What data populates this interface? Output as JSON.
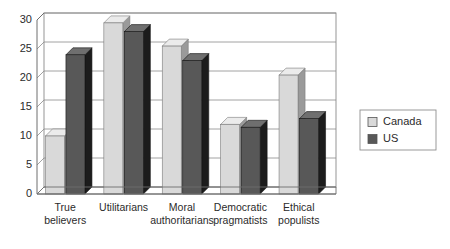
{
  "chart_data": {
    "type": "bar",
    "title": "",
    "subtitle": "",
    "xlabel": "",
    "ylabel": "",
    "categories": [
      "True believers",
      "Utilitarians",
      "Moral authoritarians",
      "Democratic pragmatists",
      "Ethical populists"
    ],
    "category_lines": [
      [
        "True",
        "believers"
      ],
      [
        "Utilitarians",
        ""
      ],
      [
        "Moral",
        "authoritarians"
      ],
      [
        "Democratic",
        "pragmatists"
      ],
      [
        "Ethical",
        "populists"
      ]
    ],
    "series": [
      {
        "name": "Canada",
        "color": "#d9d9d9",
        "values": [
          10,
          29.5,
          25.5,
          12,
          20.5
        ]
      },
      {
        "name": "US",
        "color": "#585858",
        "values": [
          24,
          28,
          23,
          11.5,
          13
        ]
      }
    ],
    "ylim": [
      0,
      30
    ],
    "yticks": [
      0,
      5,
      10,
      15,
      20,
      25,
      30
    ],
    "ytick_labels": [
      "0",
      "5",
      "10",
      "15",
      "20",
      "25",
      "30"
    ],
    "grid": true,
    "grid_axis": "y",
    "legend_position": "right",
    "style": "3d-bar",
    "colors": {
      "canada": "#d9d9d9",
      "canada_top": "#ebebeb",
      "canada_side": "#9a9a9a",
      "us": "#585858",
      "us_top": "#6f6f6f",
      "us_side": "#1c1c1c",
      "grid": "#8a8a8a",
      "axis": "#6e6e6e",
      "text": "#2b2b2b",
      "background": "#ffffff"
    }
  },
  "legend": {
    "entries": [
      {
        "label": "Canada",
        "swatch": "canada-swatch"
      },
      {
        "label": "US",
        "swatch": "us-swatch"
      }
    ]
  }
}
